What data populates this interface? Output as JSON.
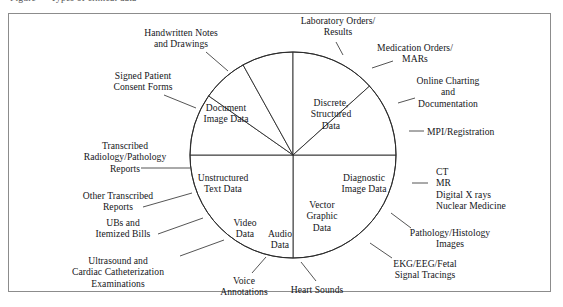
{
  "figure": {
    "clipped_caption": "Figure   —   Types of clinical data",
    "border_color": "#8c8c8c",
    "line_color": "#2a2a2a",
    "text_color": "#15161a"
  },
  "chart_data": {
    "type": "pie",
    "title": "",
    "legend": "none",
    "center": {
      "x": 293,
      "y": 155
    },
    "radius": 103,
    "note": "Angles measured in degrees, 0 = right (3 o'clock), increasing clockwise.",
    "slices": [
      {
        "label": "Discrete,\nStructured\nData",
        "start_deg": 0,
        "end_deg": 90,
        "value": 25.0
      },
      {
        "label": "Document\nImage Data",
        "start_deg": 90,
        "end_deg": 180,
        "value": 25.0
      },
      {
        "label": "Unstructured\nText Data",
        "start_deg": 180,
        "end_deg": 215,
        "value": 9.7
      },
      {
        "label": "Video\nData",
        "start_deg": 215,
        "end_deg": 241,
        "value": 7.2
      },
      {
        "label": "Audio\nData",
        "start_deg": 241,
        "end_deg": 270,
        "value": 8.1
      },
      {
        "label": "Vector\nGraphic\nData",
        "start_deg": 270,
        "end_deg": 318,
        "value": 13.3
      },
      {
        "label": "Diagnostic\nImage Data",
        "start_deg": 318,
        "end_deg": 360,
        "value": 11.7
      }
    ],
    "wedge_labels": [
      {
        "name": "discrete-structured-data",
        "lines": [
          "Discrete,",
          "Structured",
          "Data"
        ],
        "x": 331,
        "y": 97
      },
      {
        "name": "document-image-data",
        "lines": [
          "Document",
          "Image Data"
        ],
        "x": 226,
        "y": 102
      },
      {
        "name": "unstructured-text-data",
        "lines": [
          "Unstructured",
          "Text Data"
        ],
        "x": 223,
        "y": 172
      },
      {
        "name": "video-data",
        "lines": [
          "Video",
          "Data"
        ],
        "x": 245,
        "y": 217
      },
      {
        "name": "audio-data",
        "lines": [
          "Audio",
          "Data"
        ],
        "x": 280,
        "y": 228
      },
      {
        "name": "vector-graphic-data",
        "lines": [
          "Vector",
          "Graphic",
          "Data"
        ],
        "x": 322,
        "y": 199
      },
      {
        "name": "diagnostic-image-data",
        "lines": [
          "Diagnostic",
          "Image Data"
        ],
        "x": 364,
        "y": 172
      }
    ],
    "callouts": [
      {
        "name": "handwritten-notes-and-drawings",
        "lines": [
          "Handwritten Notes",
          "and Drawings"
        ],
        "align": "center",
        "x": 181,
        "y": 27,
        "leader": {
          "x1": 206,
          "y1": 52,
          "x2": 228,
          "y2": 71
        }
      },
      {
        "name": "signed-patient-consent-forms",
        "lines": [
          "Signed Patient",
          "Consent Forms"
        ],
        "align": "center",
        "x": 143,
        "y": 70,
        "leader": {
          "x1": 164,
          "y1": 95,
          "x2": 196,
          "y2": 108
        }
      },
      {
        "name": "transcribed-radiology-pathology-reports",
        "lines": [
          "Transcribed",
          "Radiology/Pathology",
          "Reports"
        ],
        "align": "center",
        "x": 125,
        "y": 140,
        "leader": {
          "x1": 141,
          "y1": 168,
          "x2": 190,
          "y2": 168
        }
      },
      {
        "name": "other-transcribed-reports",
        "lines": [
          "Other Transcribed",
          "Reports"
        ],
        "align": "center",
        "x": 118,
        "y": 190,
        "leader": {
          "x1": 143,
          "y1": 207,
          "x2": 192,
          "y2": 193
        }
      },
      {
        "name": "ubs-and-itemized-bills",
        "lines": [
          "UBs and",
          "Itemized Bills"
        ],
        "align": "center",
        "x": 123,
        "y": 217,
        "leader": {
          "x1": 158,
          "y1": 234,
          "x2": 203,
          "y2": 218
        }
      },
      {
        "name": "ultrasound-and-cardiac-catheterization-examinations",
        "lines": [
          "Ultrasound and",
          "Cardiac Catheterization",
          "Examinations"
        ],
        "align": "center",
        "x": 118,
        "y": 255,
        "leader": {
          "x1": 180,
          "y1": 256,
          "x2": 224,
          "y2": 240
        }
      },
      {
        "name": "voice-annotations",
        "lines": [
          "Voice",
          "Annotations"
        ],
        "align": "center",
        "x": 244,
        "y": 275,
        "leader": {
          "x1": 252,
          "y1": 273,
          "x2": 266,
          "y2": 257
        }
      },
      {
        "name": "heart-sounds",
        "lines": [
          "Heart Sounds"
        ],
        "align": "center",
        "x": 317,
        "y": 284,
        "leader": {
          "x1": 316,
          "y1": 281,
          "x2": 301,
          "y2": 262
        }
      },
      {
        "name": "ekg-eeg-fetal-signal-tracings",
        "lines": [
          "EKG/EEG/Fetal",
          "Signal Tracings"
        ],
        "align": "center",
        "x": 425,
        "y": 258,
        "leader": {
          "x1": 392,
          "y1": 258,
          "x2": 370,
          "y2": 243
        }
      },
      {
        "name": "pathology-histology-images",
        "lines": [
          "Pathology/Histology",
          "Images"
        ],
        "align": "center",
        "x": 450,
        "y": 227,
        "leader": {
          "x1": 411,
          "y1": 228,
          "x2": 391,
          "y2": 213
        }
      },
      {
        "name": "ct-mr-digital-xrays-nuclear-medicine",
        "lines": [
          "CT",
          "MR",
          "Digital X rays",
          "Nuclear Medicine"
        ],
        "align": "left",
        "x": 436,
        "y": 166,
        "leader": {
          "x1": 412,
          "y1": 183,
          "x2": 428,
          "y2": 183
        }
      },
      {
        "name": "mpi-registration",
        "lines": [
          "MPI/Registration"
        ],
        "align": "left",
        "x": 427,
        "y": 126,
        "leader": {
          "x1": 409,
          "y1": 131,
          "x2": 424,
          "y2": 131
        }
      },
      {
        "name": "online-charting-and-documentation",
        "lines": [
          "Online Charting",
          "and",
          "Documentation"
        ],
        "align": "center",
        "x": 448,
        "y": 75,
        "leader": {
          "x1": 398,
          "y1": 103,
          "x2": 415,
          "y2": 98
        }
      },
      {
        "name": "medication-orders-mars",
        "lines": [
          "Medication Orders/",
          "MARs"
        ],
        "align": "center",
        "x": 415,
        "y": 42,
        "leader": {
          "x1": 372,
          "y1": 68,
          "x2": 393,
          "y2": 61
        }
      },
      {
        "name": "laboratory-orders-results",
        "lines": [
          "Laboratory Orders/",
          "Results"
        ],
        "align": "center",
        "x": 338,
        "y": 15,
        "leader": {
          "x1": 336,
          "y1": 42,
          "x2": 343,
          "y2": 55
        }
      }
    ]
  }
}
